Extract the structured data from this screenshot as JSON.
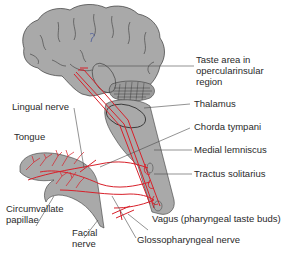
{
  "figure": {
    "colors": {
      "tissue_gray": "#a9a9a9",
      "outline": "#3a3a3a",
      "nerve_red": "#d8202a",
      "leader": "#4a4a4a",
      "text": "#2a2a2a"
    },
    "labels": {
      "taste_area_line1": "Taste area in",
      "taste_area_line2": "opercularinsular",
      "taste_area_line3": "region",
      "thalamus": "Thalamus",
      "chorda_tympani": "Chorda tympani",
      "medial_lemniscus": "Medial lemniscus",
      "tractus_solitarius": "Tractus solitarius",
      "lingual_nerve": "Lingual nerve",
      "tongue": "Tongue",
      "circumvallate_line1": "Circumvallate",
      "circumvallate_line2": "papillae",
      "facial_line1": "Facial",
      "facial_line2": "nerve",
      "vagus": "Vagus (pharyngeal taste buds)",
      "glossopharyngeal": "Glossopharyngeal nerve"
    },
    "structures": [
      "brain",
      "cerebellum",
      "thalamus",
      "brainstem",
      "tongue",
      "nerve-pathways"
    ]
  }
}
